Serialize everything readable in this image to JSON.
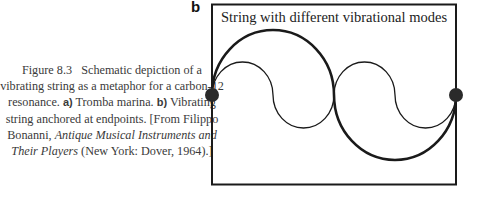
{
  "caption": {
    "figure_number": "Figure 8.3",
    "text_1": "Schematic depiction of a vibrating string as a metaphor for a carbon-12 resonance.",
    "label_a": "a)",
    "text_a": "Tromba marina.",
    "label_b": "b)",
    "text_b": "Vibrating string anchored at endpoints. [From Filippo Bonanni,",
    "book_title": "Antique Musical Instruments and Their Players",
    "text_end": "(New York: Dover, 1964).]"
  },
  "panel": {
    "label": "b",
    "title": "String with different vibrational modes",
    "modes": [
      {
        "name": "thick-mode",
        "half_wavelengths": 2
      },
      {
        "name": "thin-mode",
        "half_wavelengths": 4
      }
    ]
  }
}
